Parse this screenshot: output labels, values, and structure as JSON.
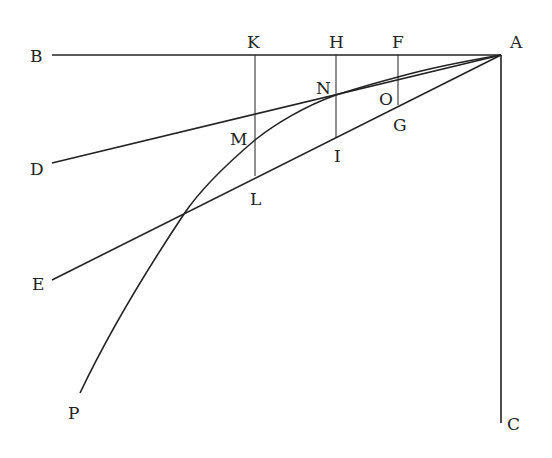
{
  "figure": {
    "type": "geometric-diagram",
    "stroke_color": "#222222",
    "background": "#ffffff",
    "points": {
      "A": {
        "label": "A",
        "x": 501,
        "y": 55
      },
      "B": {
        "label": "B",
        "x": 52,
        "y": 55
      },
      "C": {
        "label": "C",
        "x": 501,
        "y": 423
      },
      "D": {
        "label": "D",
        "x": 52,
        "y": 163
      },
      "E": {
        "label": "E",
        "x": 52,
        "y": 280
      },
      "P": {
        "label": "P",
        "x": 80,
        "y": 395
      },
      "K": {
        "label": "K",
        "x": 255,
        "y": 55
      },
      "H": {
        "label": "H",
        "x": 336,
        "y": 55
      },
      "F": {
        "label": "F",
        "x": 398,
        "y": 55
      },
      "L": {
        "label": "L",
        "x": 255,
        "y": 176
      },
      "I": {
        "label": "I",
        "x": 336,
        "y": 137
      },
      "G": {
        "label": "G",
        "x": 398,
        "y": 105
      },
      "M": {
        "label": "M",
        "x": 255,
        "y": 140
      },
      "N": {
        "label": "N",
        "x": 336,
        "y": 95
      },
      "O": {
        "label": "O",
        "x": 398,
        "y": 80
      }
    },
    "labels": [
      "B",
      "K",
      "H",
      "F",
      "A",
      "N",
      "O",
      "G",
      "M",
      "I",
      "D",
      "L",
      "E",
      "P",
      "C"
    ],
    "segments": [
      {
        "from": "B",
        "to": "A",
        "name": "line-BA"
      },
      {
        "from": "A",
        "to": "C",
        "name": "line-AC"
      },
      {
        "from": "A",
        "to": "D",
        "name": "line-AD"
      },
      {
        "from": "A",
        "to": "E",
        "name": "line-AE"
      },
      {
        "from": "K",
        "to": "L",
        "name": "ordinate-KL"
      },
      {
        "from": "H",
        "to": "I",
        "name": "ordinate-HI"
      },
      {
        "from": "F",
        "to": "G",
        "name": "ordinate-FG"
      }
    ],
    "curves": [
      {
        "name": "curve-AP",
        "through": [
          "A",
          "O",
          "N",
          "M",
          "P"
        ]
      }
    ]
  }
}
